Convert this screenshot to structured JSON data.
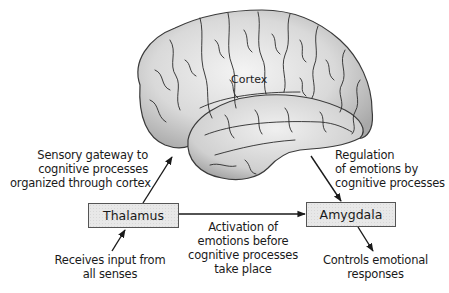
{
  "diagram": {
    "brain_label": "Cortex",
    "nodes": {
      "thalamus": {
        "label": "Thalamus"
      },
      "amygdala": {
        "label": "Amygdala"
      }
    },
    "annotations": {
      "sensory_gateway": [
        "Sensory gateway to",
        "cognitive processes",
        "organized through cortex"
      ],
      "regulation": [
        "Regulation",
        "of emotions by",
        "cognitive processes"
      ],
      "activation": [
        "Activation of",
        "emotions before",
        "cognitive processes",
        "take place"
      ],
      "receives_input": [
        "Receives input from",
        "all senses"
      ],
      "controls": [
        "Controls emotional",
        "responses"
      ]
    },
    "edges": [
      {
        "from": "senses",
        "to": "thalamus",
        "label": "Receives input from all senses"
      },
      {
        "from": "thalamus",
        "to": "cortex",
        "label": "Sensory gateway to cognitive processes organized through cortex"
      },
      {
        "from": "thalamus",
        "to": "amygdala",
        "label": "Activation of emotions before cognitive processes take place"
      },
      {
        "from": "cortex",
        "to": "amygdala",
        "label": "Regulation of emotions by cognitive processes"
      },
      {
        "from": "amygdala",
        "to": "responses",
        "label": "Controls emotional responses"
      }
    ],
    "colors": {
      "stroke": "#1a1a1a",
      "brain_fill": "#d4d4d4",
      "box_fill": "#e8e8e8"
    }
  }
}
